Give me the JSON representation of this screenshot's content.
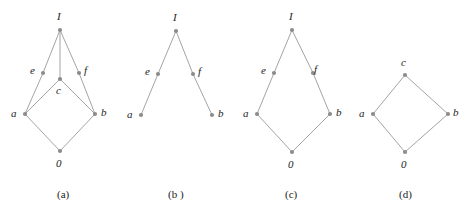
{
  "figure": {
    "background_color": "#ffffff",
    "edge_color": "#9a9a9a",
    "node_color": "#8c8c8c",
    "label_color": "#1c1c1c",
    "node_radius": 2.1,
    "edge_width": 0.9,
    "diagrams": [
      {
        "id": "a",
        "caption": "(a)",
        "caption_x": 57,
        "caption_y": 189,
        "nodes": [
          {
            "name": "I",
            "label": "I",
            "x": 60,
            "y": 30,
            "label_x": 57,
            "label_y": 11
          },
          {
            "name": "e",
            "label": "e",
            "x": 43,
            "y": 73,
            "label_x": 30,
            "label_y": 65
          },
          {
            "name": "c",
            "label": "c",
            "x": 60,
            "y": 79,
            "label_x": 56,
            "label_y": 85
          },
          {
            "name": "f",
            "label": "f",
            "x": 79,
            "y": 73,
            "label_x": 84,
            "label_y": 65
          },
          {
            "name": "a",
            "label": "a",
            "x": 25,
            "y": 114,
            "label_x": 11,
            "label_y": 108
          },
          {
            "name": "b",
            "label": "b",
            "x": 95,
            "y": 114,
            "label_x": 101,
            "label_y": 107
          },
          {
            "name": "0",
            "label": "0",
            "x": 60,
            "y": 151,
            "label_x": 56,
            "label_y": 158
          }
        ],
        "edges": [
          [
            "a",
            "e"
          ],
          [
            "a",
            "c"
          ],
          [
            "a",
            "0"
          ],
          [
            "b",
            "f"
          ],
          [
            "b",
            "c"
          ],
          [
            "b",
            "0"
          ],
          [
            "e",
            "I"
          ],
          [
            "c",
            "I"
          ],
          [
            "f",
            "I"
          ]
        ]
      },
      {
        "id": "b",
        "caption": "(b )",
        "caption_x": 168,
        "caption_y": 189,
        "nodes": [
          {
            "name": "I",
            "label": "I",
            "x": 176,
            "y": 31,
            "label_x": 173,
            "label_y": 12
          },
          {
            "name": "e",
            "label": "e",
            "x": 158,
            "y": 74,
            "label_x": 145,
            "label_y": 66
          },
          {
            "name": "f",
            "label": "f",
            "x": 193,
            "y": 74,
            "label_x": 198,
            "label_y": 66
          },
          {
            "name": "a",
            "label": "a",
            "x": 141,
            "y": 115,
            "label_x": 127,
            "label_y": 109
          },
          {
            "name": "b",
            "label": "b",
            "x": 212,
            "y": 115,
            "label_x": 218,
            "label_y": 108
          }
        ],
        "edges": [
          [
            "a",
            "e"
          ],
          [
            "e",
            "I"
          ],
          [
            "b",
            "f"
          ],
          [
            "f",
            "I"
          ]
        ]
      },
      {
        "id": "c",
        "caption": "(c)",
        "caption_x": 285,
        "caption_y": 189,
        "nodes": [
          {
            "name": "I",
            "label": "I",
            "x": 292,
            "y": 30,
            "label_x": 289,
            "label_y": 11
          },
          {
            "name": "e",
            "label": "e",
            "x": 274,
            "y": 73,
            "label_x": 261,
            "label_y": 65
          },
          {
            "name": "f",
            "label": "f",
            "x": 313,
            "y": 73,
            "label_x": 314,
            "label_y": 64
          },
          {
            "name": "a",
            "label": "a",
            "x": 257,
            "y": 114,
            "label_x": 243,
            "label_y": 108
          },
          {
            "name": "b",
            "label": "b",
            "x": 330,
            "y": 114,
            "label_x": 336,
            "label_y": 107
          },
          {
            "name": "0",
            "label": "0",
            "x": 292,
            "y": 152,
            "label_x": 288,
            "label_y": 159
          }
        ],
        "edges": [
          [
            "0",
            "a"
          ],
          [
            "0",
            "b"
          ],
          [
            "a",
            "e"
          ],
          [
            "b",
            "f"
          ],
          [
            "e",
            "I"
          ],
          [
            "f",
            "I"
          ]
        ]
      },
      {
        "id": "d",
        "caption": "(d)",
        "caption_x": 399,
        "caption_y": 189,
        "nodes": [
          {
            "name": "c",
            "label": "c",
            "x": 405,
            "y": 75,
            "label_x": 401,
            "label_y": 57
          },
          {
            "name": "a",
            "label": "a",
            "x": 373,
            "y": 114,
            "label_x": 359,
            "label_y": 108
          },
          {
            "name": "b",
            "label": "b",
            "x": 448,
            "y": 114,
            "label_x": 453,
            "label_y": 107
          },
          {
            "name": "0",
            "label": "0",
            "x": 405,
            "y": 152,
            "label_x": 401,
            "label_y": 159
          }
        ],
        "edges": [
          [
            "0",
            "a"
          ],
          [
            "0",
            "b"
          ],
          [
            "a",
            "c"
          ],
          [
            "b",
            "c"
          ]
        ]
      }
    ]
  }
}
